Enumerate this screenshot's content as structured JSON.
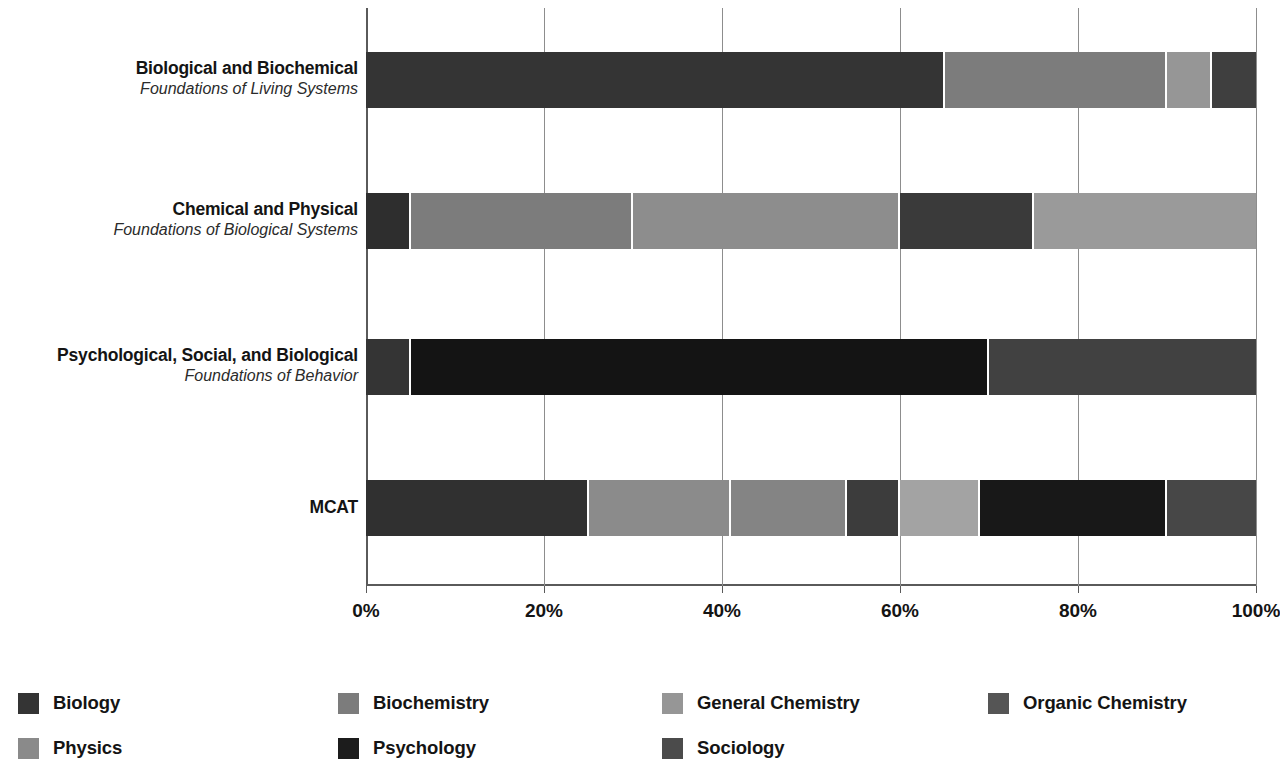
{
  "chart_data": {
    "type": "bar",
    "orientation": "horizontal",
    "stacked": true,
    "normalized": true,
    "title": "",
    "xlabel": "",
    "ylabel": "",
    "xlim": [
      0,
      100
    ],
    "grid": true,
    "legend_position": "bottom",
    "xticks": [
      0,
      20,
      40,
      60,
      80,
      100
    ],
    "xtick_labels": [
      "0%",
      "20%",
      "40%",
      "60%",
      "80%",
      "100%"
    ],
    "categories": [
      {
        "main": "Biological and Biochemical",
        "sub": "Foundations of Living Systems"
      },
      {
        "main": "Chemical and Physical",
        "sub": "Foundations of Biological Systems"
      },
      {
        "main": "Psychological, Social, and Biological",
        "sub": "Foundations of Behavior"
      },
      {
        "main": "MCAT",
        "sub": ""
      }
    ],
    "series": [
      {
        "name": "Biology",
        "color": "#343434",
        "values": [
          65,
          5,
          5,
          25
        ]
      },
      {
        "name": "Biochemistry",
        "color": "#7c7c7c",
        "values": [
          25,
          25,
          0,
          16
        ]
      },
      {
        "name": "General Chemistry",
        "color": "#969696",
        "values": [
          0,
          30,
          0,
          13
        ]
      },
      {
        "name": "Organic Chemistry",
        "color": "#555555",
        "values": [
          0,
          15,
          0,
          6
        ]
      },
      {
        "name": "Physics",
        "color": "#8a8a8a",
        "values": [
          0,
          25,
          0,
          9
        ]
      },
      {
        "name": "Psychology",
        "color": "#1c1c1c",
        "values": [
          0,
          0,
          65,
          21
        ]
      },
      {
        "name": "Sociology",
        "color": "#4b4b4b",
        "values": [
          0,
          0,
          30,
          10
        ]
      }
    ],
    "stacks": [
      [
        {
          "name": "Biology",
          "start": 0,
          "end": 65,
          "value": 65,
          "color": "#343434"
        },
        {
          "name": "Biochemistry",
          "start": 65,
          "end": 90,
          "value": 25,
          "color": "#7c7c7c"
        },
        {
          "name": "General Chemistry",
          "start": 90,
          "end": 95,
          "value": 5,
          "color": "#969696"
        },
        {
          "name": "Organic Chemistry",
          "start": 95,
          "end": 100,
          "value": 5,
          "color": "#3f3f3f"
        }
      ],
      [
        {
          "name": "Biology",
          "start": 0,
          "end": 5,
          "value": 5,
          "color": "#2e2e2e"
        },
        {
          "name": "Biochemistry",
          "start": 5,
          "end": 30,
          "value": 25,
          "color": "#7c7c7c"
        },
        {
          "name": "General Chemistry",
          "start": 30,
          "end": 60,
          "value": 30,
          "color": "#8d8d8d"
        },
        {
          "name": "Organic Chemistry",
          "start": 60,
          "end": 75,
          "value": 15,
          "color": "#3a3a3a"
        },
        {
          "name": "Physics",
          "start": 75,
          "end": 100,
          "value": 25,
          "color": "#9a9a9a"
        }
      ],
      [
        {
          "name": "Biology",
          "start": 0,
          "end": 5,
          "value": 5,
          "color": "#343434"
        },
        {
          "name": "Psychology",
          "start": 5,
          "end": 70,
          "value": 65,
          "color": "#141414"
        },
        {
          "name": "Sociology",
          "start": 70,
          "end": 100,
          "value": 30,
          "color": "#414141"
        }
      ],
      [
        {
          "name": "Biology",
          "start": 0,
          "end": 25,
          "value": 25,
          "color": "#303030"
        },
        {
          "name": "Biochemistry",
          "start": 25,
          "end": 41,
          "value": 16,
          "color": "#8b8b8b"
        },
        {
          "name": "General Chemistry",
          "start": 41,
          "end": 54,
          "value": 13,
          "color": "#848484"
        },
        {
          "name": "Organic Chemistry",
          "start": 54,
          "end": 60,
          "value": 6,
          "color": "#3c3c3c"
        },
        {
          "name": "Physics",
          "start": 60,
          "end": 69,
          "value": 9,
          "color": "#a3a3a3"
        },
        {
          "name": "Psychology",
          "start": 69,
          "end": 90,
          "value": 21,
          "color": "#181818"
        },
        {
          "name": "Sociology",
          "start": 90,
          "end": 100,
          "value": 10,
          "color": "#474747"
        }
      ]
    ]
  },
  "legend": {
    "items": [
      {
        "label": "Biology",
        "color": "#343434"
      },
      {
        "label": "Biochemistry",
        "color": "#7c7c7c"
      },
      {
        "label": "General Chemistry",
        "color": "#969696"
      },
      {
        "label": "Organic Chemistry",
        "color": "#555555"
      },
      {
        "label": "Physics",
        "color": "#8a8a8a"
      },
      {
        "label": "Psychology",
        "color": "#1c1c1c"
      },
      {
        "label": "Sociology",
        "color": "#4b4b4b"
      }
    ]
  }
}
